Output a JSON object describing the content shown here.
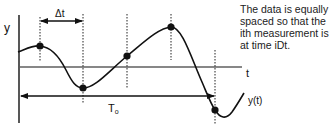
{
  "diagram": {
    "axis_labels": {
      "y": "y",
      "t": "t",
      "curve": "y(t)"
    },
    "interval_label": "Δt",
    "period_label_main": "T",
    "period_label_sub": "o",
    "note": "The data is equally spaced so that the ith measurement is at time iDt.",
    "sample_points": [
      {
        "x": 40,
        "y": 46
      },
      {
        "x": 83,
        "y": 88
      },
      {
        "x": 127,
        "y": 56
      },
      {
        "x": 171,
        "y": 27
      },
      {
        "x": 215,
        "y": 110
      }
    ],
    "colors": {
      "line": "#111111",
      "background": "#ffffff"
    }
  }
}
